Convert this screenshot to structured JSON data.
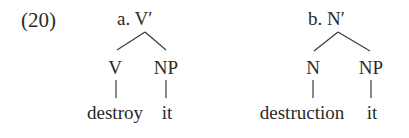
{
  "example_number": "(20)",
  "trees": [
    {
      "label": "a. V′",
      "children": [
        {
          "label": "V",
          "leaf": "destroy"
        },
        {
          "label": "NP",
          "leaf": "it"
        }
      ]
    },
    {
      "label": "b. N′",
      "children": [
        {
          "label": "N",
          "leaf": "destruction"
        },
        {
          "label": "NP",
          "leaf": "it"
        }
      ]
    }
  ]
}
